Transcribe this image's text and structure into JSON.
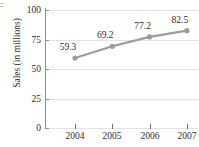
{
  "corner_fragment": "::",
  "chart_data": {
    "type": "line",
    "title": "",
    "xlabel": "",
    "ylabel": "Sales (in millions)",
    "categories": [
      "2004",
      "2005",
      "2006",
      "2007"
    ],
    "values": [
      59.3,
      69.2,
      77.2,
      82.5
    ],
    "point_labels": [
      "59.3",
      "69.2",
      "77.2",
      "82.5"
    ],
    "ylim": [
      0,
      100
    ],
    "yticks": [
      0,
      25,
      50,
      75,
      100
    ],
    "ytick_labels": [
      "0",
      "25",
      "50",
      "75",
      "100"
    ],
    "grid": "horizontal",
    "legend": "none",
    "series": [
      {
        "name": "Sales",
        "values": [
          59.3,
          69.2,
          77.2,
          82.5
        ],
        "line_color": "#9b9b9b",
        "marker_color": "#9b9b9b",
        "marker": "circle"
      }
    ],
    "colors": {
      "line": "#9b9b9b",
      "marker": "#9b9b9b",
      "grid": "#e3e3e3",
      "axis": "#8d8d8d",
      "text": "#2e2e2e",
      "background": "#ffffff"
    }
  }
}
